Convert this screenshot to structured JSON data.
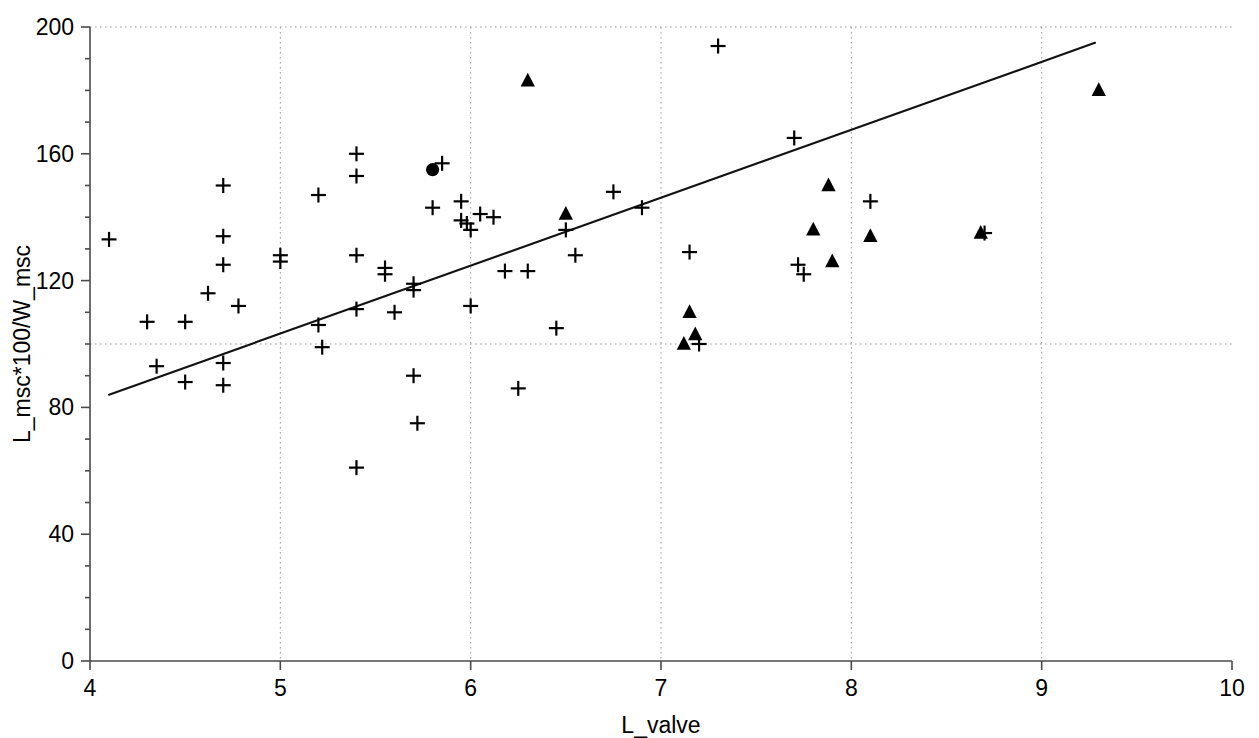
{
  "chart_data": {
    "type": "scatter",
    "title": "",
    "xlabel": "L_valve",
    "ylabel": "L_msc*100/W_msc",
    "xlim": [
      4,
      10
    ],
    "ylim": [
      0,
      200
    ],
    "xticks": [
      4,
      5,
      6,
      7,
      8,
      9,
      10
    ],
    "yticks": [
      0,
      40,
      80,
      120,
      160,
      200
    ],
    "xtick_labels": [
      "4",
      "5",
      "6",
      "7",
      "8",
      "9",
      "10"
    ],
    "ytick_labels": [
      "0",
      "40",
      "80",
      "120",
      "160",
      "200"
    ],
    "grid": {
      "enabled": true,
      "style": "dotted",
      "vertical_at": [
        5,
        6,
        7,
        8,
        9
      ],
      "horizontal_at": [
        100,
        200
      ],
      "color": "#9a9a9a"
    },
    "legend": {
      "visible": false,
      "entries": []
    },
    "annotations": [],
    "series": [
      {
        "name": "plus",
        "marker": "plus",
        "color": "#000000",
        "points": [
          [
            4.1,
            133
          ],
          [
            4.3,
            107
          ],
          [
            4.35,
            93
          ],
          [
            4.5,
            107
          ],
          [
            4.5,
            88
          ],
          [
            4.62,
            116
          ],
          [
            4.7,
            150
          ],
          [
            4.7,
            134
          ],
          [
            4.7,
            125
          ],
          [
            4.7,
            94
          ],
          [
            4.7,
            87
          ],
          [
            4.78,
            112
          ],
          [
            5.0,
            128
          ],
          [
            5.0,
            126
          ],
          [
            5.2,
            147
          ],
          [
            5.2,
            106
          ],
          [
            5.22,
            99
          ],
          [
            5.4,
            160
          ],
          [
            5.4,
            153
          ],
          [
            5.4,
            128
          ],
          [
            5.4,
            111
          ],
          [
            5.4,
            61
          ],
          [
            5.55,
            124
          ],
          [
            5.55,
            122
          ],
          [
            5.6,
            110
          ],
          [
            5.7,
            119
          ],
          [
            5.7,
            117
          ],
          [
            5.7,
            90
          ],
          [
            5.72,
            75
          ],
          [
            5.8,
            143
          ],
          [
            5.85,
            157
          ],
          [
            5.95,
            145
          ],
          [
            5.95,
            139
          ],
          [
            5.98,
            138
          ],
          [
            6.0,
            136
          ],
          [
            6.0,
            112
          ],
          [
            6.05,
            141
          ],
          [
            6.12,
            140
          ],
          [
            6.18,
            123
          ],
          [
            6.25,
            86
          ],
          [
            6.3,
            123
          ],
          [
            6.45,
            105
          ],
          [
            6.5,
            136
          ],
          [
            6.55,
            128
          ],
          [
            6.75,
            148
          ],
          [
            6.9,
            143
          ],
          [
            7.15,
            129
          ],
          [
            7.2,
            100
          ],
          [
            7.3,
            194
          ],
          [
            7.7,
            165
          ],
          [
            7.72,
            125
          ],
          [
            7.75,
            122
          ],
          [
            8.1,
            145
          ],
          [
            8.7,
            135
          ]
        ]
      },
      {
        "name": "triangle",
        "marker": "triangle",
        "color": "#000000",
        "points": [
          [
            6.3,
            183
          ],
          [
            6.5,
            141
          ],
          [
            7.15,
            110
          ],
          [
            7.18,
            103
          ],
          [
            7.12,
            100
          ],
          [
            7.8,
            136
          ],
          [
            7.88,
            150
          ],
          [
            7.9,
            126
          ],
          [
            8.1,
            134
          ],
          [
            8.68,
            135
          ],
          [
            9.3,
            180
          ]
        ]
      },
      {
        "name": "circle",
        "marker": "circle",
        "color": "#000000",
        "points": [
          [
            5.8,
            155
          ]
        ]
      }
    ],
    "fit_line": {
      "name": "regression-line",
      "color": "#111111",
      "x_start": 4.1,
      "y_start": 84,
      "x_end": 9.28,
      "y_end": 195
    }
  }
}
